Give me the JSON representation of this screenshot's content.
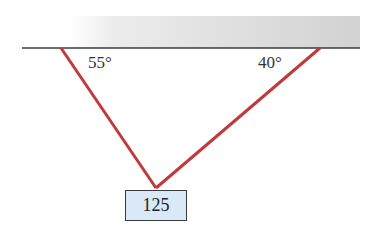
{
  "diagram": {
    "ceiling": {
      "fill_start": "#ffffff",
      "fill_end": "#d2d2d2",
      "line_color": "#3a3a3a"
    },
    "ropes": {
      "color": "#c0393b"
    },
    "angles": {
      "left": "55°",
      "right": "40°"
    },
    "weight": {
      "value": "125",
      "fill": "#d9e9f7"
    }
  }
}
